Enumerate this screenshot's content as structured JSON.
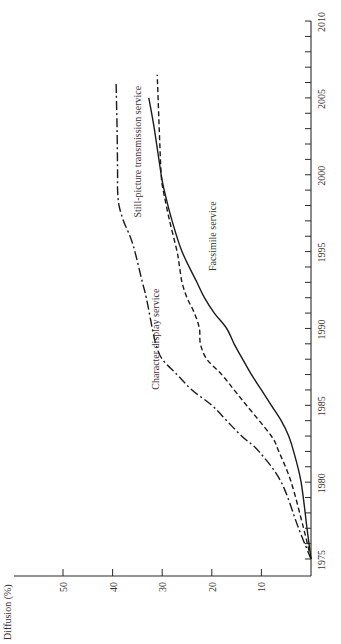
{
  "chart_data": {
    "type": "line",
    "orientation": "rotated-90-ccw",
    "title": "",
    "xlabel": "",
    "ylabel": "Diffusion (%)",
    "xlim": [
      1975,
      2010
    ],
    "ylim": [
      0,
      60
    ],
    "x_ticks": [
      1975,
      1980,
      1985,
      1990,
      1995,
      2000,
      2005,
      2010
    ],
    "y_ticks": [
      10,
      20,
      30,
      40,
      50
    ],
    "grid": false,
    "legend": "inline labels",
    "series": [
      {
        "name": "Character display service",
        "style": "dash-dot",
        "x": [
          1975,
          1977,
          1980,
          1982,
          1983,
          1984,
          1985,
          1986,
          1987,
          1988,
          1989,
          1990,
          1992,
          1993,
          1995,
          1996,
          1997,
          1998,
          1999,
          2000,
          2003,
          2006
        ],
        "y": [
          0,
          2.5,
          6,
          10.5,
          14,
          17,
          20,
          24,
          27,
          30,
          31.3,
          32,
          33.2,
          34,
          35.5,
          36.5,
          37.8,
          38.7,
          39,
          39,
          39.1,
          39.3
        ]
      },
      {
        "name": "Still-picture transmission service",
        "style": "dashed",
        "x": [
          1975,
          1977,
          1980,
          1982,
          1983,
          1985,
          1986,
          1987,
          1988,
          1989,
          1990,
          1991,
          1992,
          1993,
          1994,
          1995,
          1997,
          1999,
          2000,
          2003,
          2006.5
        ],
        "y": [
          0,
          1.5,
          4,
          6.5,
          8,
          13,
          15.5,
          18,
          21,
          22.3,
          22.5,
          23.5,
          25,
          26,
          26.5,
          27,
          28.5,
          29.8,
          30.2,
          30.6,
          31
        ]
      },
      {
        "name": "Facsimile service",
        "style": "solid",
        "x": [
          1975,
          1977,
          1980,
          1982,
          1983,
          1984,
          1985,
          1986,
          1987,
          1988,
          1989,
          1990,
          1991,
          1992,
          1993,
          1995,
          1997,
          1999,
          2000,
          2003,
          2005
        ],
        "y": [
          0,
          0.8,
          2,
          3.5,
          4.5,
          6,
          8,
          10,
          12,
          13.8,
          15.5,
          17,
          19.5,
          21.5,
          23,
          26,
          28,
          29.6,
          30.2,
          31.6,
          32.7
        ]
      }
    ],
    "annotations": [
      {
        "text": "Still-picture transmission service",
        "year": 2001.5,
        "value": 34.2
      },
      {
        "text": "Facsimile service",
        "year": 1996,
        "value": 19.2
      },
      {
        "text": "Character display service",
        "year": 1989.3,
        "value": 30.6
      }
    ]
  },
  "axes": {
    "y_title": "Diffusion (%)"
  }
}
